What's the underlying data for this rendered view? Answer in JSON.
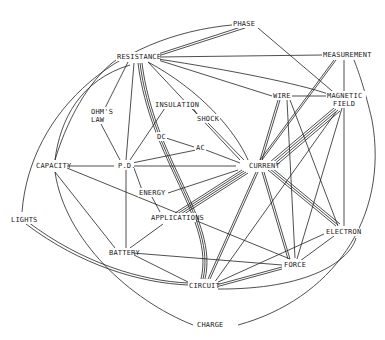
{
  "diagram": {
    "type": "concept-map",
    "background": "#ffffff",
    "ink": "#222222",
    "nodes": [
      {
        "id": "phase",
        "label": "PHASE",
        "x": 250,
        "y": 24
      },
      {
        "id": "resistance",
        "label": "RESISTANCE",
        "x": 136,
        "y": 57
      },
      {
        "id": "measurement",
        "label": "MEASUREMENT",
        "x": 345,
        "y": 55
      },
      {
        "id": "wire",
        "label": "WIRE",
        "x": 284,
        "y": 96
      },
      {
        "id": "magnetic_field_1",
        "label": "MAGNETIC",
        "x": 344,
        "y": 96
      },
      {
        "id": "magnetic_field_2",
        "label": "FIELD",
        "x": 344,
        "y": 104
      },
      {
        "id": "ohms_law_1",
        "label": "OHM'S",
        "x": 99,
        "y": 112
      },
      {
        "id": "ohms_law_2",
        "label": "LAW",
        "x": 99,
        "y": 120
      },
      {
        "id": "insulation",
        "label": "INSULATION",
        "x": 175,
        "y": 105
      },
      {
        "id": "shock",
        "label": "SHOCK",
        "x": 205,
        "y": 119
      },
      {
        "id": "dc",
        "label": "DC",
        "x": 160,
        "y": 137
      },
      {
        "id": "ac",
        "label": "AC",
        "x": 200,
        "y": 148
      },
      {
        "id": "capacity",
        "label": "CAPACITY",
        "x": 44,
        "y": 166
      },
      {
        "id": "pd",
        "label": "P.D.",
        "x": 124,
        "y": 166
      },
      {
        "id": "current",
        "label": "CURRENT",
        "x": 258,
        "y": 166
      },
      {
        "id": "energy",
        "label": "ENERGY",
        "x": 155,
        "y": 193
      },
      {
        "id": "applications",
        "label": "APPLICATIONS",
        "x": 172,
        "y": 218
      },
      {
        "id": "lights",
        "label": "LIGHTS",
        "x": 22,
        "y": 220
      },
      {
        "id": "battery",
        "label": "BATTERY",
        "x": 118,
        "y": 253
      },
      {
        "id": "electron",
        "label": "ELECTRON",
        "x": 341,
        "y": 232
      },
      {
        "id": "force",
        "label": "FORCE",
        "x": 292,
        "y": 265
      },
      {
        "id": "circuit",
        "label": "CIRCUIT",
        "x": 201,
        "y": 285
      },
      {
        "id": "charge",
        "label": "CHARGE",
        "x": 216,
        "y": 325
      }
    ],
    "edges": [
      {
        "from": "resistance",
        "to": "phase",
        "style": "double"
      },
      {
        "from": "resistance",
        "to": "measurement",
        "style": "single"
      },
      {
        "from": "resistance",
        "to": "wire",
        "style": "single"
      },
      {
        "from": "resistance",
        "to": "magnetic_field",
        "style": "single"
      },
      {
        "from": "resistance",
        "to": "ohms_law",
        "style": "single"
      },
      {
        "from": "resistance",
        "to": "pd",
        "style": "single"
      },
      {
        "from": "resistance",
        "to": "circuit",
        "style": "triple"
      },
      {
        "from": "resistance",
        "to": "current",
        "style": "single"
      },
      {
        "from": "resistance",
        "to": "capacity",
        "style": "single"
      },
      {
        "from": "phase",
        "to": "capacity",
        "style": "single"
      },
      {
        "from": "phase",
        "to": "magnetic_field",
        "style": "single"
      },
      {
        "from": "measurement",
        "to": "current",
        "style": "double"
      },
      {
        "from": "measurement",
        "to": "electron",
        "style": "single"
      },
      {
        "from": "measurement",
        "to": "charge",
        "style": "single"
      },
      {
        "from": "wire",
        "to": "magnetic_field",
        "style": "single"
      },
      {
        "from": "wire",
        "to": "current",
        "style": "double"
      },
      {
        "from": "wire",
        "to": "force",
        "style": "single"
      },
      {
        "from": "wire",
        "to": "electron",
        "style": "single"
      },
      {
        "from": "magnetic_field",
        "to": "current",
        "style": "quad"
      },
      {
        "from": "magnetic_field",
        "to": "force",
        "style": "single"
      },
      {
        "from": "ohms_law",
        "to": "pd",
        "style": "single"
      },
      {
        "from": "insulation",
        "to": "shock",
        "style": "single"
      },
      {
        "from": "insulation",
        "to": "pd",
        "style": "single"
      },
      {
        "from": "shock",
        "to": "current",
        "style": "single"
      },
      {
        "from": "dc",
        "to": "ac",
        "style": "single"
      },
      {
        "from": "ac",
        "to": "current",
        "style": "single"
      },
      {
        "from": "ac",
        "to": "pd",
        "style": "single"
      },
      {
        "from": "capacity",
        "to": "pd",
        "style": "single"
      },
      {
        "from": "capacity",
        "to": "current",
        "style": "single"
      },
      {
        "from": "capacity",
        "to": "battery",
        "style": "single"
      },
      {
        "from": "capacity",
        "to": "charge",
        "style": "single"
      },
      {
        "from": "pd",
        "to": "current",
        "style": "single"
      },
      {
        "from": "pd",
        "to": "energy",
        "style": "single"
      },
      {
        "from": "pd",
        "to": "battery",
        "style": "single"
      },
      {
        "from": "pd",
        "to": "force",
        "style": "single"
      },
      {
        "from": "energy",
        "to": "current",
        "style": "single"
      },
      {
        "from": "energy",
        "to": "applications",
        "style": "single"
      },
      {
        "from": "applications",
        "to": "current",
        "style": "quad"
      },
      {
        "from": "applications",
        "to": "battery",
        "style": "single"
      },
      {
        "from": "current",
        "to": "circuit",
        "style": "double"
      },
      {
        "from": "current",
        "to": "force",
        "style": "double"
      },
      {
        "from": "current",
        "to": "electron",
        "style": "triple"
      },
      {
        "from": "battery",
        "to": "circuit",
        "style": "single"
      },
      {
        "from": "battery",
        "to": "force",
        "style": "single"
      },
      {
        "from": "lights",
        "to": "circuit",
        "style": "double"
      },
      {
        "from": "lights",
        "to": "resistance",
        "style": "single"
      },
      {
        "from": "electron",
        "to": "circuit",
        "style": "single"
      },
      {
        "from": "electron",
        "to": "force",
        "style": "single"
      },
      {
        "from": "electron",
        "to": "charge",
        "style": "single"
      },
      {
        "from": "force",
        "to": "circuit",
        "style": "double"
      },
      {
        "from": "circuit",
        "to": "magnetic_field",
        "style": "single"
      }
    ]
  }
}
